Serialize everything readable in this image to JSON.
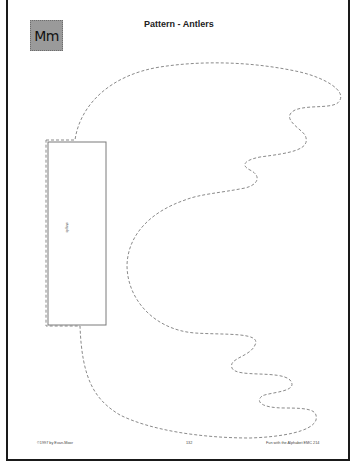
{
  "page": {
    "letter_badge": "Mm",
    "title": "Pattern - Antlers",
    "pattern": {
      "name": "antlers",
      "tab_label": "staple",
      "outline_style": "dashed",
      "outline_color": "#8a8a8a"
    },
    "footer": {
      "copyright": "©1997 by Evan-Moor",
      "page_number": "132",
      "book": "Fun with the Alphabet EMC 214"
    }
  }
}
